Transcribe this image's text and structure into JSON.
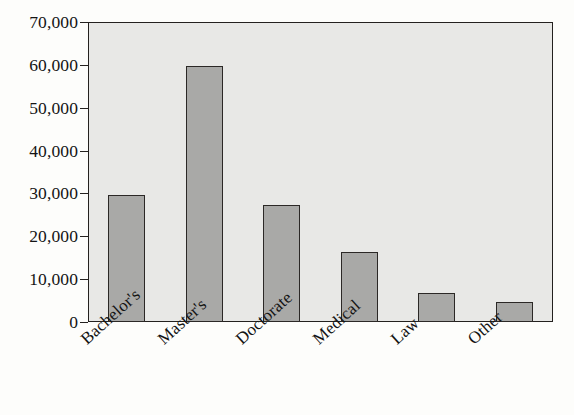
{
  "chart_data": {
    "type": "bar",
    "title": "",
    "xlabel": "",
    "ylabel": "",
    "categories": [
      "Bachelor's",
      "Master's",
      "Doctorate",
      "Medical",
      "Law",
      "Other"
    ],
    "values": [
      29700,
      59800,
      27300,
      16400,
      6700,
      4700
    ],
    "ylim": [
      0,
      70000
    ],
    "y_ticks": [
      0,
      10000,
      20000,
      30000,
      40000,
      50000,
      60000,
      70000
    ],
    "y_tick_labels": [
      "0",
      "10,000",
      "20,000",
      "30,000",
      "40,000",
      "50,000",
      "60,000",
      "70,000"
    ],
    "grid": false,
    "legend": null,
    "bar_fill_color": "#a9a9a7",
    "bar_edge_color": "#2b2826",
    "plot_background_color": "#e8e8e6",
    "figure_background_color": "#fdfdfb",
    "axis_color": "#24211f",
    "x_label_rotation_degrees": -42
  }
}
